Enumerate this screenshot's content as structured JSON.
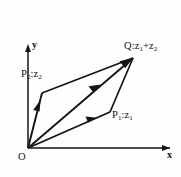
{
  "figure": {
    "background_color": "#fefefe",
    "ink_color": "#141414",
    "axes": {
      "x_label": "x",
      "y_label": "y",
      "origin_label": "O",
      "origin_px": [
        28,
        148
      ],
      "x_axis_end_px": [
        172,
        148
      ],
      "y_axis_end_px": [
        28,
        46
      ]
    },
    "points": [
      {
        "id": "P1",
        "label": "P",
        "sub": "1",
        "sep": ":z",
        "sub2": "1",
        "text": "P1:z1",
        "px": [
          110,
          112
        ]
      },
      {
        "id": "P2",
        "label": "P",
        "sub": "2",
        "sep": ":z",
        "sub2": "2",
        "text": "P2:z2",
        "px": [
          42,
          93
        ]
      },
      {
        "id": "Q",
        "label": "Q",
        "sub": "",
        "sep": ":z",
        "sub2": "1",
        "text": "Q:z1+z2",
        "px": [
          133,
          58
        ]
      }
    ],
    "labels": {
      "q_prefix": "Q:z",
      "q_sub1": "1",
      "q_plus": "+z",
      "q_sub2": "2",
      "p2_prefix": "P",
      "p2_sub_a": "2",
      "p2_mid": ":z",
      "p2_sub_b": "2",
      "p1_prefix": "P",
      "p1_sub_a": "1",
      "p1_mid": ":z",
      "p1_sub_b": "1"
    },
    "segments": [
      {
        "name": "origin-to-p1",
        "from": [
          28,
          148
        ],
        "to": [
          110,
          112
        ],
        "arrow": "mid-forward"
      },
      {
        "name": "origin-to-p2",
        "from": [
          28,
          148
        ],
        "to": [
          42,
          93
        ],
        "arrow": "mid-forward"
      },
      {
        "name": "origin-to-q",
        "from": [
          28,
          148
        ],
        "to": [
          133,
          58
        ],
        "arrow": "mid-forward-and-tip"
      },
      {
        "name": "p2-to-q",
        "from": [
          42,
          93
        ],
        "to": [
          133,
          58
        ],
        "arrow": "none"
      },
      {
        "name": "p1-to-q",
        "from": [
          110,
          112
        ],
        "to": [
          133,
          58
        ],
        "arrow": "none"
      }
    ]
  }
}
